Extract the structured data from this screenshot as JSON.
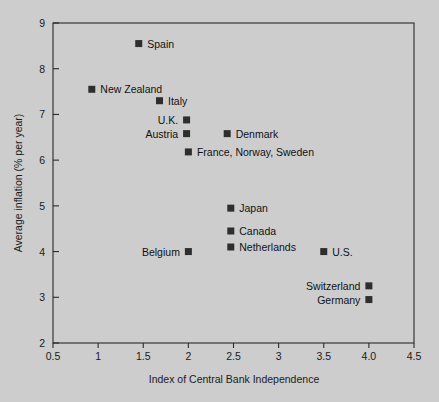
{
  "chart_data": {
    "type": "scatter",
    "title": "",
    "xlabel": "Index of Central Bank Independence",
    "ylabel": "Average inflation (% per year)",
    "xlim": [
      0.5,
      4.5
    ],
    "ylim": [
      2,
      9
    ],
    "grid": false,
    "legend": "none",
    "xticks": [
      0.5,
      1,
      1.5,
      2,
      2.5,
      3,
      3.5,
      4.0,
      4.5
    ],
    "xtick_labels": [
      "0.5",
      "1",
      "1.5",
      "2",
      "2.5",
      "3",
      "3.5",
      "4.0",
      "4.5"
    ],
    "yticks": [
      2,
      3,
      4,
      5,
      6,
      7,
      8,
      9
    ],
    "ytick_labels": [
      "2",
      "3",
      "4",
      "5",
      "6",
      "7",
      "8",
      "9"
    ],
    "marker": "filled-square",
    "marker_color": "#2e2e2e",
    "points": [
      {
        "label": "Spain",
        "x": 1.45,
        "y": 8.55,
        "label_side": "right"
      },
      {
        "label": "New Zealand",
        "x": 0.93,
        "y": 7.55,
        "label_side": "right"
      },
      {
        "label": "Italy",
        "x": 1.68,
        "y": 7.3,
        "label_side": "right"
      },
      {
        "label": "U.K.",
        "x": 1.98,
        "y": 6.88,
        "label_side": "left"
      },
      {
        "label": "Austria",
        "x": 1.98,
        "y": 6.58,
        "label_side": "left"
      },
      {
        "label": "Denmark",
        "x": 2.43,
        "y": 6.58,
        "label_side": "right"
      },
      {
        "label": "France, Norway, Sweden",
        "x": 2.0,
        "y": 6.18,
        "label_side": "right"
      },
      {
        "label": "Japan",
        "x": 2.47,
        "y": 4.95,
        "label_side": "right"
      },
      {
        "label": "Canada",
        "x": 2.47,
        "y": 4.45,
        "label_side": "right"
      },
      {
        "label": "Netherlands",
        "x": 2.47,
        "y": 4.1,
        "label_side": "right"
      },
      {
        "label": "Belgium",
        "x": 2.0,
        "y": 4.0,
        "label_side": "left"
      },
      {
        "label": "U.S.",
        "x": 3.5,
        "y": 4.0,
        "label_side": "right"
      },
      {
        "label": "Switzerland",
        "x": 4.0,
        "y": 3.25,
        "label_side": "left"
      },
      {
        "label": "Germany",
        "x": 4.0,
        "y": 2.95,
        "label_side": "left"
      }
    ]
  },
  "figure": {
    "background_color": "#cdcdcd",
    "axis_color": "#2b2b2b",
    "text_color": "#111111"
  }
}
